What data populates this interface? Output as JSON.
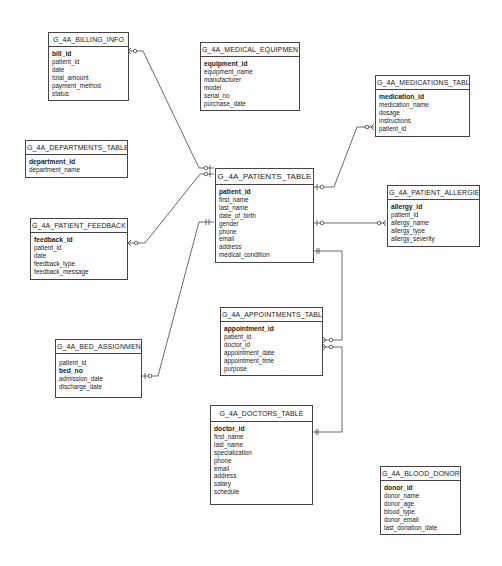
{
  "diagram": {
    "type": "entity-relationship",
    "entities": {
      "billing_info": {
        "title": "G_4A_BILLING_INFO",
        "fields": [
          "bill_id",
          "patient_id",
          "date",
          "total_amount",
          "payment_method",
          "status"
        ],
        "primary_key": "bill_id"
      },
      "medical_equipment": {
        "title": "G_4A_MEDICAL_EQUIPMENT",
        "fields": [
          "equipment_id",
          "equipment_name",
          "manufacturer",
          "model",
          "serial_no",
          "purchase_date"
        ],
        "primary_key": "equipment_id"
      },
      "medications": {
        "title": "G_4A_MEDICATIONS_TABLE",
        "fields": [
          "medication_id",
          "medication_name",
          "dosage",
          "instructions",
          "patient_id"
        ],
        "primary_key": "medication_id"
      },
      "departments": {
        "title": "G_4A_DEPARTMENTS_TABLE",
        "fields": [
          "department_id",
          "department_name"
        ],
        "primary_key": "department_id"
      },
      "patient_feedback": {
        "title": "G_4A_PATIENT_FEEDBACK",
        "fields": [
          "feedback_id",
          "patient_id",
          "date",
          "feedback_type",
          "feedback_message"
        ],
        "primary_key": "feedback_id"
      },
      "patients": {
        "title": "G_4A_PATIENTS_TABLE",
        "fields": [
          "patient_id",
          "first_name",
          "last_name",
          "date_of_birth",
          "gender",
          "phone",
          "email",
          "address",
          "medical_condition"
        ],
        "primary_key": "patient_id"
      },
      "patient_allergies": {
        "title": "G_4A_PATIENT_ALLERGIES",
        "fields": [
          "allergy_id",
          "patient_id",
          "allergy_name",
          "allergy_type",
          "allergy_severity"
        ],
        "primary_key": "allergy_id"
      },
      "appointments": {
        "title": "G_4A_APPOINTMENTS_TABLE",
        "fields": [
          "appointment_id",
          "patient_id",
          "doctor_id",
          "appointment_date",
          "appointment_time",
          "purpose"
        ],
        "primary_key": "appointment_id"
      },
      "bed_assignment": {
        "title": "G_4A_BED_ASSIGNMENT",
        "fields": [
          "patient_id",
          "bed_no",
          "admission_date",
          "discharge_date"
        ],
        "primary_key": "bed_no"
      },
      "doctors": {
        "title": "G_4A_DOCTORS_TABLE",
        "fields": [
          "doctor_id",
          "first_name",
          "last_name",
          "specialization",
          "phone",
          "email",
          "address",
          "salary",
          "schedule"
        ],
        "primary_key": "doctor_id"
      },
      "blood_donors": {
        "title": "G_4A_BLOOD_DONORS",
        "fields": [
          "donor_id",
          "donor_name",
          "donor_age",
          "blood_type",
          "donor_email",
          "last_donation_date"
        ],
        "primary_key": "donor_id"
      }
    },
    "relationships": [
      {
        "from": "G_4A_PATIENTS_TABLE",
        "to": "G_4A_BILLING_INFO",
        "from_card": "zero-or-one",
        "to_card": "zero-or-many"
      },
      {
        "from": "G_4A_PATIENTS_TABLE",
        "to": "G_4A_PATIENT_FEEDBACK",
        "from_card": "zero-or-one",
        "to_card": "zero-or-many"
      },
      {
        "from": "G_4A_PATIENTS_TABLE",
        "to": "G_4A_BED_ASSIGNMENT",
        "from_card": "one-and-only-one",
        "to_card": "zero-or-one"
      },
      {
        "from": "G_4A_PATIENTS_TABLE",
        "to": "G_4A_MEDICATIONS_TABLE",
        "from_card": "zero-or-one",
        "to_card": "zero-or-many"
      },
      {
        "from": "G_4A_PATIENTS_TABLE",
        "to": "G_4A_PATIENT_ALLERGIES",
        "from_card": "zero-or-one",
        "to_card": "zero-or-many"
      },
      {
        "from": "G_4A_PATIENTS_TABLE",
        "to": "G_4A_APPOINTMENTS_TABLE",
        "from_card": "one-and-only-one",
        "to_card": "zero-or-many"
      },
      {
        "from": "G_4A_DOCTORS_TABLE",
        "to": "G_4A_APPOINTMENTS_TABLE",
        "from_card": "one-and-only-one",
        "to_card": "zero-or-many"
      }
    ],
    "colors": {
      "line": "#444444",
      "background": "#ffffff",
      "text": "#222222"
    }
  }
}
